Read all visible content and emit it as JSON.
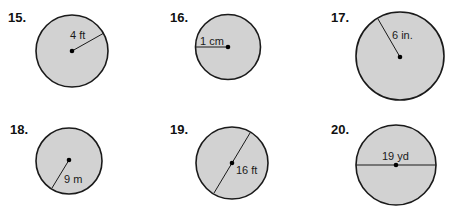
{
  "problems": [
    {
      "number": "15.",
      "label": "4 ft",
      "measure": "radius"
    },
    {
      "number": "16.",
      "label": "1 cm",
      "measure": "radius"
    },
    {
      "number": "17.",
      "label": "6 in.",
      "measure": "radius"
    },
    {
      "number": "18.",
      "label": "9 m",
      "measure": "radius"
    },
    {
      "number": "19.",
      "label": "16 ft",
      "measure": "diameter"
    },
    {
      "number": "20.",
      "label": "19 yd",
      "measure": "diameter"
    }
  ],
  "colors": {
    "circle_fill": "#d2d2d2",
    "stroke": "#1a1a1a",
    "background": "#ffffff"
  }
}
